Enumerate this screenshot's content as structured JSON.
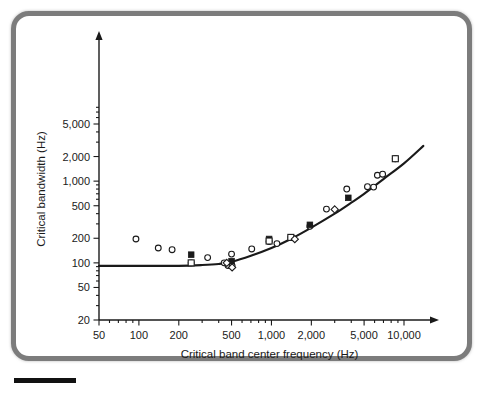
{
  "figure": {
    "frame_color": "#7c7c7c",
    "background_color": "#ffffff",
    "ink_color": "#1a1a1a"
  },
  "chart_data": {
    "type": "scatter",
    "title": "",
    "xlabel": "Critical band center frequency (Hz)",
    "ylabel": "Critical bandwidth (Hz)",
    "xscale": "log",
    "yscale": "log",
    "xlim": [
      40,
      16000
    ],
    "ylim": [
      20,
      9000
    ],
    "grid": false,
    "legend": null,
    "xticks": [
      50,
      100,
      200,
      500,
      1000,
      2000,
      5000,
      10000
    ],
    "xtick_labels": [
      "50",
      "100",
      "200",
      "500",
      "1,000",
      "2,000",
      "5,000",
      "10,000"
    ],
    "yticks": [
      20,
      50,
      100,
      200,
      500,
      1000,
      2000,
      5000
    ],
    "ytick_labels": [
      "20",
      "50",
      "100",
      "200",
      "500",
      "1,000",
      "2,000",
      "5,000"
    ],
    "series": [
      {
        "name": "open-circle-data",
        "marker": "open-circle",
        "points": [
          [
            95,
            196
          ],
          [
            140,
            152
          ],
          [
            178,
            145
          ],
          [
            248,
            100
          ],
          [
            330,
            116
          ],
          [
            440,
            100
          ],
          [
            470,
            93
          ],
          [
            500,
            128
          ],
          [
            505,
            92
          ],
          [
            710,
            148
          ],
          [
            960,
            182
          ],
          [
            1100,
            172
          ],
          [
            1400,
            205
          ],
          [
            1950,
            280
          ],
          [
            2600,
            455
          ],
          [
            3700,
            800
          ],
          [
            5300,
            855
          ],
          [
            5900,
            845
          ],
          [
            6300,
            1180
          ],
          [
            6900,
            1215
          ],
          [
            8600,
            1880
          ]
        ]
      },
      {
        "name": "filled-square-data",
        "marker": "filled-square",
        "points": [
          [
            248,
            126
          ],
          [
            500,
            105
          ],
          [
            960,
            196
          ],
          [
            1950,
            292
          ],
          [
            3800,
            625
          ]
        ]
      },
      {
        "name": "open-square-data",
        "marker": "open-square",
        "points": [
          [
            248,
            100
          ],
          [
            960,
            185
          ],
          [
            1400,
            205
          ],
          [
            8600,
            1880
          ]
        ]
      },
      {
        "name": "open-diamond-data",
        "marker": "open-diamond",
        "points": [
          [
            460,
            100
          ],
          [
            505,
            88
          ],
          [
            1500,
            195
          ],
          [
            3000,
            450
          ]
        ]
      }
    ],
    "fitted_curve": {
      "name": "critical-bandwidth-fit",
      "description": "Smooth fitted critical bandwidth function, flat near 92 Hz below ~500 Hz then rising",
      "points": [
        [
          50,
          92
        ],
        [
          100,
          92
        ],
        [
          200,
          92
        ],
        [
          300,
          94
        ],
        [
          400,
          97
        ],
        [
          500,
          103
        ],
        [
          700,
          122
        ],
        [
          1000,
          152
        ],
        [
          1400,
          196
        ],
        [
          2000,
          270
        ],
        [
          3000,
          400
        ],
        [
          4000,
          545
        ],
        [
          5000,
          700
        ],
        [
          7000,
          1060
        ],
        [
          10000,
          1650
        ],
        [
          14000,
          2700
        ]
      ]
    }
  }
}
